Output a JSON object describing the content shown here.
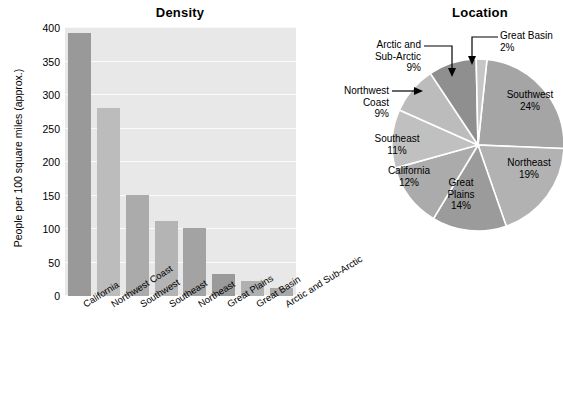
{
  "chart_data": [
    {
      "type": "bar",
      "title": "Density",
      "xlabel": "",
      "ylabel": "People per 100 square miles (approx.)",
      "ylim": [
        0,
        400
      ],
      "yticks": [
        0,
        50,
        100,
        150,
        200,
        250,
        300,
        350,
        400
      ],
      "grid": true,
      "legend": "none",
      "categories": [
        "California",
        "Northwest Coast",
        "Southwest",
        "Southeast",
        "Northeast",
        "Great Plains",
        "Great Basin",
        "Arctic and Sub-Arctic"
      ],
      "values": [
        392,
        280,
        151,
        112,
        102,
        33,
        22,
        12
      ],
      "bar_colors": [
        "#999999",
        "#bcbcbc",
        "#ababab",
        "#b4b4b4",
        "#a3a3a3",
        "#9a9a9a",
        "#b0b0b0",
        "#a8a8a8"
      ],
      "plot_background": "#e8e8e8",
      "gridline_color": "#fafafa"
    },
    {
      "type": "pie",
      "title": "Location",
      "legend": "callouts",
      "labels": [
        "Southwest",
        "Northeast",
        "Great Plains",
        "California",
        "Southeast",
        "Northwest Coast",
        "Arctic and Sub-Arctic",
        "Great Basin"
      ],
      "values": [
        24,
        19,
        14,
        12,
        11,
        9,
        9,
        2
      ],
      "value_labels": [
        "24%",
        "19%",
        "14%",
        "12%",
        "11%",
        "9%",
        "9%",
        "2%"
      ],
      "slice_colors": [
        "#a5a5a5",
        "#b2b2b2",
        "#9b9b9b",
        "#ababab",
        "#c0c0c0",
        "#bcbcbc",
        "#8f8f8f",
        "#c6c6c6"
      ]
    }
  ],
  "bar_chart": {
    "title": "Density",
    "ylabel": "People per 100 square miles (approx.)",
    "yticks": [
      "400",
      "350",
      "300",
      "250",
      "200",
      "150",
      "100",
      "50",
      "0"
    ],
    "categories": [
      {
        "label": "California"
      },
      {
        "label": "Northwest Coast"
      },
      {
        "label": "Southwest"
      },
      {
        "label": "Southeast"
      },
      {
        "label": "Northeast"
      },
      {
        "label": "Great Plains"
      },
      {
        "label": "Great Basin"
      },
      {
        "label": "Arctic and Sub-Arctic"
      }
    ]
  },
  "pie_chart": {
    "title": "Location",
    "callouts": [
      {
        "name": "arctic",
        "line1": "Arctic and",
        "line2": "Sub-Arctic",
        "line3": "9%"
      },
      {
        "name": "great-basin",
        "line1": "Great Basin",
        "line2": "2%",
        "line3": ""
      },
      {
        "name": "northwest-coast",
        "line1": "Northwest",
        "line2": "Coast",
        "line3": "9%"
      }
    ],
    "inner_labels": [
      {
        "name": "southwest",
        "line1": "Southwest",
        "line2": "24%"
      },
      {
        "name": "northeast",
        "line1": "Northeast",
        "line2": "19%"
      },
      {
        "name": "great-plains",
        "line1": "Great",
        "line2": "Plains",
        "line3": "14%"
      },
      {
        "name": "california",
        "line1": "California",
        "line2": "12%"
      },
      {
        "name": "southeast",
        "line1": "Southeast",
        "line2": "11%"
      }
    ]
  }
}
